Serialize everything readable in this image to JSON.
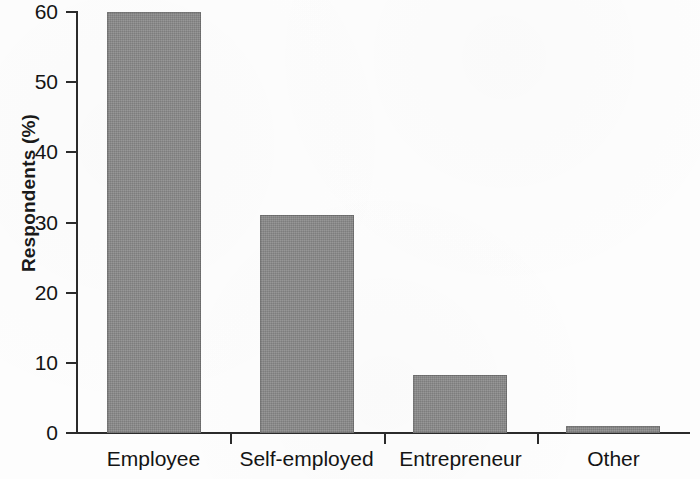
{
  "chart_data": {
    "type": "bar",
    "title": "",
    "subtitle": "",
    "xlabel": "",
    "ylabel": "Respondents (%)",
    "categories": [
      "Employee",
      "Self-employed",
      "Entrepreneur",
      "Other"
    ],
    "values": [
      60,
      31,
      8.3,
      1
    ],
    "series": [
      {
        "name": "Respondents",
        "values": [
          60,
          31,
          8.3,
          1
        ]
      }
    ],
    "ylim": [
      0,
      60
    ],
    "yticks": [
      0,
      10,
      20,
      30,
      40,
      50,
      60
    ],
    "ytick_labels": [
      "0",
      "10",
      "20",
      "30",
      "40",
      "50",
      "60"
    ],
    "grid": false,
    "legend": false,
    "legend_position": "none",
    "bar_color": "#8b8b8b",
    "axis_color": "#2b2b2b",
    "background_color": "#fdfdfd",
    "annotations": []
  }
}
